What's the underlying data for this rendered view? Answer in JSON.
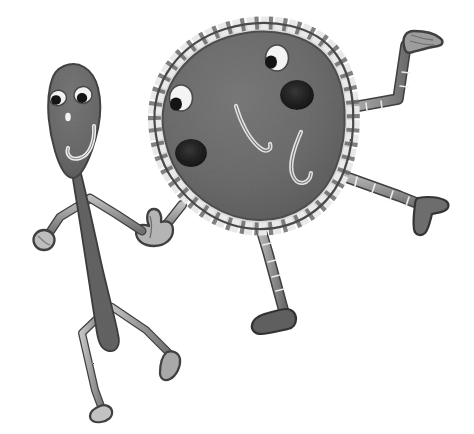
{
  "scene": {
    "title": "Two cartoon stick characters holding hands",
    "medium": "pencil and ink illustration, grayscale",
    "background_color": "#ffffff",
    "width": 474,
    "height": 434,
    "alt_text": "A tall thin teardrop-headed stick figure on the left holds hands with a large round segmented-rim blob character on the right; both have smiling faces and dancing limbs."
  },
  "palette": {
    "paper_white": "#ffffff",
    "body_gray": "#6e6e6e",
    "body_gray_dark": "#5a5a5a",
    "limb_gray": "#8e8e8e",
    "limb_gray_light": "#b5b5b5",
    "outline_dark": "#3a3a3a",
    "ink_black": "#1a1a1a",
    "highlight_white": "#f2f2f2",
    "rim_light": "#c8c8c8",
    "shadow_gray": "#9a9a9a",
    "torso_dark": "#646464"
  },
  "characters": [
    {
      "id": "thin-figure",
      "name": "Thin teardrop character",
      "position": "left",
      "head_shape": "teardrop / egg, wide at top tapering down",
      "head_fill": "#6e6e6e",
      "eye_count": 2,
      "eye_fill": "#f4f4f4",
      "pupil_fill": "#141414",
      "nose": "small white dot",
      "mouth": "white curved smile, open hook",
      "arm_count": 2,
      "leg_count": 2,
      "left_hand": "rounded mitten blob",
      "right_hand": "clasping partner's hand",
      "foot_shape": "small rounded shoe"
    },
    {
      "id": "round-figure",
      "name": "Round segmented-rim character",
      "position": "right",
      "head_shape": "large irregular circle / blob",
      "body_fill": "#6e6e6e",
      "rim_pattern": "alternating light-gray and white dashed segments",
      "rim_segment_count": 46,
      "eye_count": 2,
      "eye_fill": "#f4f4f4",
      "pupil_fill": "#141414",
      "cheek_blush_count": 2,
      "cheek_blush_fill": "#232323",
      "nose": "long curved hook line, light",
      "mouth": "U-shaped curve, light",
      "arm_count": 2,
      "raised_arm": "upper right, bent at elbow, mitten hand",
      "lowered_arm": "lower right, bent, dark flipper hand",
      "leg_count": 1,
      "foot_shape": "dark rounded shoe pointing left"
    }
  ],
  "labels": {
    "figure_caption": "",
    "credit": ""
  }
}
